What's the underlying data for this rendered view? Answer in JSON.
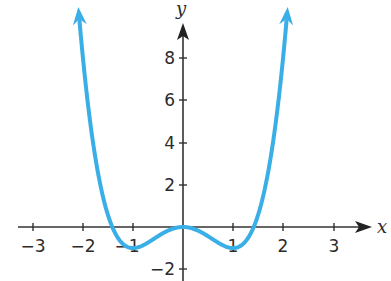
{
  "chart_data": {
    "type": "line",
    "title": "",
    "xlabel": "x",
    "ylabel": "y",
    "function": "y = x^4 - 2x^2",
    "xlim": [
      -3.5,
      3.8
    ],
    "ylim": [
      -2.5,
      10
    ],
    "x_ticks": [
      -3,
      -2,
      -1,
      1,
      2,
      3
    ],
    "x_tick_labels": [
      "−3",
      "−2",
      "−1",
      "1",
      "2",
      "3"
    ],
    "y_ticks": [
      -2,
      2,
      4,
      6,
      8
    ],
    "y_tick_labels": [
      "−2",
      "2",
      "4",
      "6",
      "8"
    ],
    "grid": false,
    "legend": null,
    "series": [
      {
        "name": "curve",
        "color": "#3aaee6",
        "x": [
          -2.1,
          -2.0,
          -1.75,
          -1.5,
          -1.414,
          -1.25,
          -1.0,
          -0.75,
          -0.5,
          -0.25,
          0,
          0.25,
          0.5,
          0.75,
          1.0,
          1.25,
          1.414,
          1.5,
          1.75,
          2.0,
          2.1
        ],
        "values": [
          10.63,
          8.0,
          3.25,
          0.56,
          0.0,
          -0.68,
          -1.0,
          -0.81,
          -0.44,
          -0.12,
          0,
          -0.12,
          -0.44,
          -0.81,
          -1.0,
          -0.68,
          0.0,
          0.56,
          3.25,
          8.0,
          10.63
        ],
        "arrows": "both ends"
      }
    ],
    "key_points": [
      {
        "x": -1,
        "y": -1,
        "label": "local minimum"
      },
      {
        "x": 0,
        "y": 0,
        "label": "local maximum"
      },
      {
        "x": 1,
        "y": -1,
        "label": "local minimum"
      }
    ]
  },
  "axes": {
    "x_label": "x",
    "y_label": "y"
  },
  "ticks": {
    "x": [
      "−3",
      "−2",
      "−1",
      "1",
      "2",
      "3"
    ],
    "y": [
      "8",
      "6",
      "4",
      "2",
      "−2"
    ]
  },
  "colors": {
    "curve": "#3aaee6",
    "axis": "#333333"
  }
}
